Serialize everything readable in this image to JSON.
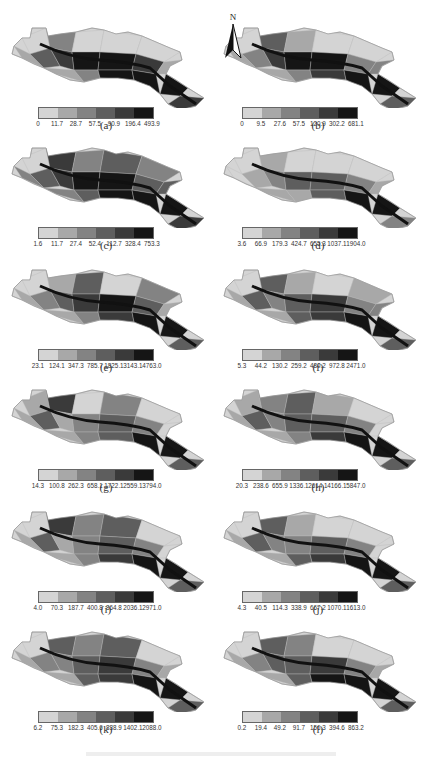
{
  "figure": {
    "north_arrow_label": "N",
    "panel_colors": [
      "#d4d4d4",
      "#a8a8a8",
      "#838383",
      "#5e5e5e",
      "#3a3a3a",
      "#151515"
    ],
    "panels": [
      {
        "label": "(a)",
        "breaks": [
          "0",
          "11.7",
          "28.7",
          "57.5",
          "90.9",
          "196.4",
          "493.9"
        ]
      },
      {
        "label": "(b)",
        "breaks": [
          "0",
          "9.5",
          "27.6",
          "57.5",
          "120.9",
          "302.2",
          "681.1"
        ]
      },
      {
        "label": "(c)",
        "breaks": [
          "1.6",
          "11.7",
          "27.4",
          "52.4",
          "112.7",
          "328.4",
          "753.3"
        ]
      },
      {
        "label": "(d)",
        "breaks": [
          "3.6",
          "66.9",
          "179.3",
          "424.7",
          "655.3",
          "1037.1",
          "1904.0"
        ]
      },
      {
        "label": "(e)",
        "breaks": [
          "23.1",
          "124.1",
          "347.3",
          "785.7",
          "1825.1",
          "3143.1",
          "4763.0"
        ]
      },
      {
        "label": "(f)",
        "breaks": [
          "5.3",
          "44.2",
          "130.2",
          "259.2",
          "480.2",
          "972.8",
          "2471.0"
        ]
      },
      {
        "label": "(g)",
        "breaks": [
          "14.3",
          "100.8",
          "262.3",
          "658.1",
          "1722.1",
          "2559.1",
          "3794.0"
        ]
      },
      {
        "label": "(h)",
        "breaks": [
          "20.3",
          "238.6",
          "655.9",
          "1336.1",
          "2614.1",
          "4166.1",
          "5847.0"
        ]
      },
      {
        "label": "(i)",
        "breaks": [
          "4.0",
          "70.3",
          "187.7",
          "400.8",
          "864.8",
          "2036.1",
          "2971.0"
        ]
      },
      {
        "label": "(j)",
        "breaks": [
          "4.3",
          "40.5",
          "114.3",
          "338.9",
          "667.2",
          "1070.1",
          "1613.0"
        ]
      },
      {
        "label": "(k)",
        "breaks": [
          "6.2",
          "75.3",
          "182.3",
          "405.6",
          "838.9",
          "1402.1",
          "2088.0"
        ]
      },
      {
        "label": "(l)",
        "breaks": [
          "0.2",
          "19.4",
          "49.2",
          "91.7",
          "156.3",
          "394.6",
          "863.2"
        ]
      }
    ]
  },
  "chart_data": [
    {
      "type": "heatmap",
      "title": "(a)",
      "legend_classes": 6,
      "colormap": "grayscale light-to-dark",
      "class_breaks": [
        0,
        11.7,
        28.7,
        57.5,
        90.9,
        196.4,
        493.9
      ]
    },
    {
      "type": "heatmap",
      "title": "(b)",
      "legend_classes": 6,
      "colormap": "grayscale light-to-dark",
      "class_breaks": [
        0,
        9.5,
        27.6,
        57.5,
        120.9,
        302.2,
        681.1
      ]
    },
    {
      "type": "heatmap",
      "title": "(c)",
      "legend_classes": 6,
      "colormap": "grayscale light-to-dark",
      "class_breaks": [
        1.6,
        11.7,
        27.4,
        52.4,
        112.7,
        328.4,
        753.3
      ]
    },
    {
      "type": "heatmap",
      "title": "(d)",
      "legend_classes": 6,
      "colormap": "grayscale light-to-dark",
      "class_breaks": [
        3.6,
        66.9,
        179.3,
        424.7,
        655.3,
        1037.1,
        1904.0
      ]
    },
    {
      "type": "heatmap",
      "title": "(e)",
      "legend_classes": 6,
      "colormap": "grayscale light-to-dark",
      "class_breaks": [
        23.1,
        124.1,
        347.3,
        785.7,
        1825.1,
        3143.1,
        4763.0
      ]
    },
    {
      "type": "heatmap",
      "title": "(f)",
      "legend_classes": 6,
      "colormap": "grayscale light-to-dark",
      "class_breaks": [
        5.3,
        44.2,
        130.2,
        259.2,
        480.2,
        972.8,
        2471.0
      ]
    },
    {
      "type": "heatmap",
      "title": "(g)",
      "legend_classes": 6,
      "colormap": "grayscale light-to-dark",
      "class_breaks": [
        14.3,
        100.8,
        262.3,
        658.1,
        1722.1,
        2559.1,
        3794.0
      ]
    },
    {
      "type": "heatmap",
      "title": "(h)",
      "legend_classes": 6,
      "colormap": "grayscale light-to-dark",
      "class_breaks": [
        20.3,
        238.6,
        655.9,
        1336.1,
        2614.1,
        4166.1,
        5847.0
      ]
    },
    {
      "type": "heatmap",
      "title": "(i)",
      "legend_classes": 6,
      "colormap": "grayscale light-to-dark",
      "class_breaks": [
        4.0,
        70.3,
        187.7,
        400.8,
        864.8,
        2036.1,
        2971.0
      ]
    },
    {
      "type": "heatmap",
      "title": "(j)",
      "legend_classes": 6,
      "colormap": "grayscale light-to-dark",
      "class_breaks": [
        4.3,
        40.5,
        114.3,
        338.9,
        667.2,
        1070.1,
        1613.0
      ]
    },
    {
      "type": "heatmap",
      "title": "(k)",
      "legend_classes": 6,
      "colormap": "grayscale light-to-dark",
      "class_breaks": [
        6.2,
        75.3,
        182.3,
        405.6,
        838.9,
        1402.1,
        2088.0
      ]
    },
    {
      "type": "heatmap",
      "title": "(l)",
      "legend_classes": 6,
      "colormap": "grayscale light-to-dark",
      "class_breaks": [
        0.2,
        19.4,
        49.2,
        91.7,
        156.3,
        394.6,
        863.2
      ]
    }
  ]
}
